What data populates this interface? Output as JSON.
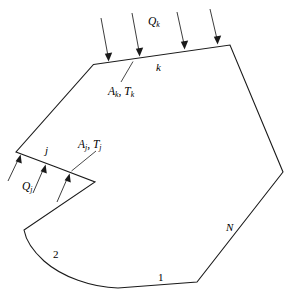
{
  "figure": {
    "background_color": "#ffffff",
    "line_color": "#1a1a1a",
    "width": 295,
    "height": 306
  },
  "labels": {
    "heat_flux_top": "Q",
    "heat_flux_top_sub": "k",
    "surface_k": "k",
    "area_temp_k_area": "A",
    "area_temp_k_area_sub": "k",
    "area_temp_k_separator": ", ",
    "area_temp_k_temp": "T",
    "area_temp_k_temp_sub": "k",
    "surface_j": "j",
    "area_temp_j_area": "A",
    "area_temp_j_area_sub": "j",
    "area_temp_j_separator": ", ",
    "area_temp_j_temp": "T",
    "area_temp_j_temp_sub": "j",
    "heat_flux_left": "Q",
    "heat_flux_left_sub": "j",
    "surface_n": "N",
    "surface_two": "2",
    "surface_one": "1"
  },
  "geometry": {
    "outline_path": "M 93.5,64.5 L 230,45 L 283,172 L 197,282 L 118,288 C 78,286 40,262 24,230 L 95,182 L 56,167 L 16,152 Z",
    "top_edge": {
      "x1": 93.5,
      "y1": 64.5,
      "x2": 230,
      "y2": 45
    },
    "edge_j": {
      "x1": 16,
      "y1": 152,
      "x2": 56,
      "y2": 167
    },
    "notch_tip": {
      "x": 95,
      "y": 182
    },
    "right_vertex": {
      "x": 283,
      "y": 172
    },
    "bottom_edge": {
      "x1": 118,
      "y1": 288,
      "x2": 197,
      "y2": 282
    }
  },
  "arrows": {
    "top_flux": [
      {
        "x1": 101,
        "y1": 18,
        "x2": 108.5,
        "y2": 59
      },
      {
        "x1": 132,
        "y1": 13,
        "x2": 139.5,
        "y2": 54
      },
      {
        "x1": 177,
        "y1": 12,
        "x2": 184.5,
        "y2": 47
      },
      {
        "x1": 210,
        "y1": 9,
        "x2": 217.5,
        "y2": 44
      }
    ],
    "left_flux": [
      {
        "x1": 8,
        "y1": 180,
        "x2": 20.5,
        "y2": 155
      },
      {
        "x1": 33,
        "y1": 192,
        "x2": 45.5,
        "y2": 164
      },
      {
        "x1": 57,
        "y1": 201,
        "x2": 69.5,
        "y2": 173
      }
    ]
  },
  "leaders": {
    "ak_tk": {
      "x1": 122,
      "y1": 83,
      "x2": 133,
      "y2": 62
    },
    "aj_tj": {
      "x1": 97,
      "y1": 152,
      "x2": 70,
      "y2": 172
    }
  }
}
